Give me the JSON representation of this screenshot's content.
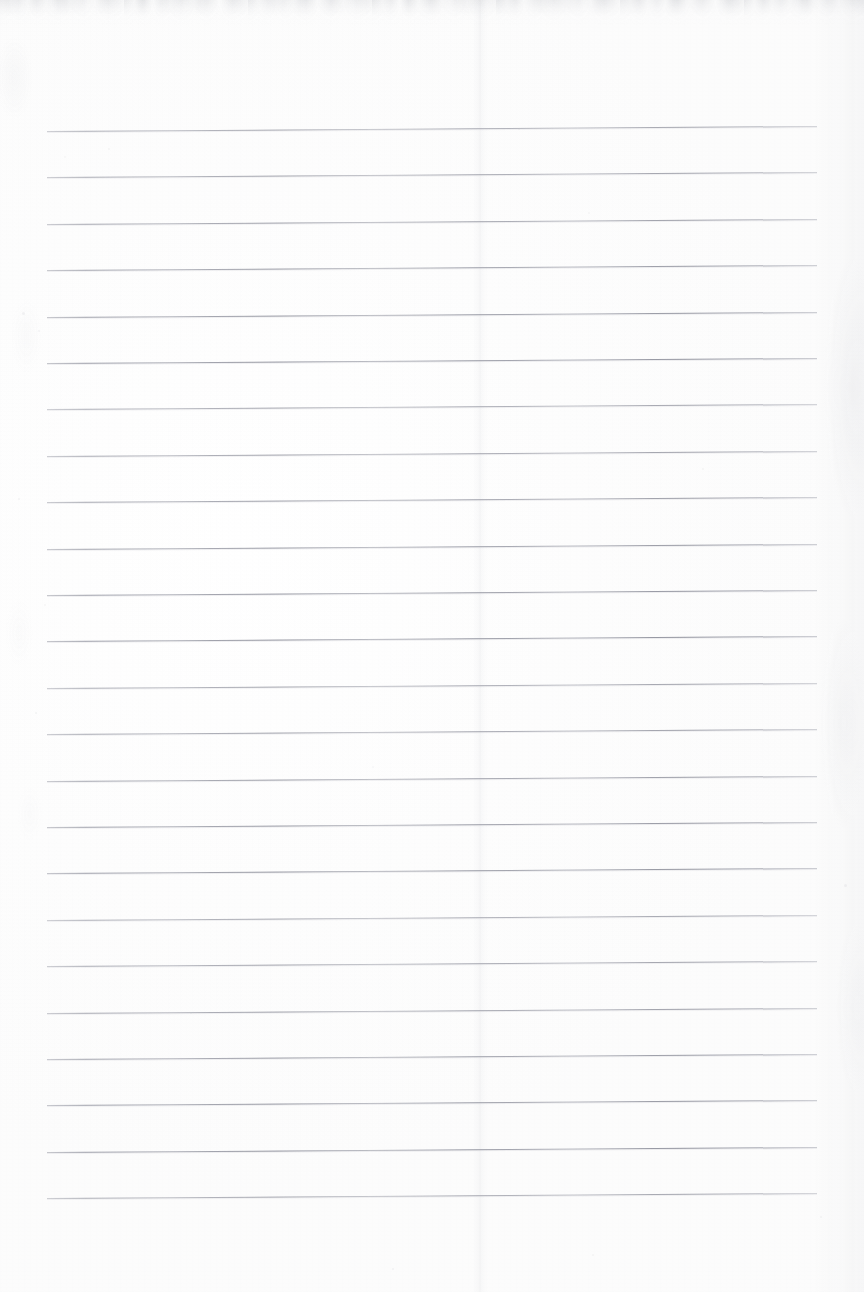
{
  "document": {
    "type": "scanned-ruled-notebook-paper",
    "title": "",
    "visible_text": "",
    "page_width": 864,
    "page_height": 1292,
    "background_color": "#fdfdfd",
    "has_handwriting": false,
    "has_printed_text": false
  },
  "ruling": {
    "line_color": "#8c8e9a",
    "line_thickness_px": 1,
    "line_count": 24,
    "line_left_x": 47,
    "line_right_x": 817,
    "line_length_px": 770,
    "first_line_y": 131,
    "last_line_y": 1198,
    "line_spacing_px": 46.4,
    "skew_degrees": -0.37,
    "lines_y": [
      131,
      177.4,
      223.8,
      270.2,
      316.6,
      363.0,
      409.4,
      455.8,
      502.2,
      548.6,
      595.0,
      641.4,
      687.8,
      734.2,
      780.6,
      827.0,
      873.4,
      919.8,
      966.2,
      1012.6,
      1059.0,
      1105.4,
      1151.8,
      1198.2
    ]
  },
  "margins": {
    "top_margin_px": 131,
    "left_margin_px": 47,
    "right_margin_px": 47,
    "bottom_margin_px": 94
  },
  "scan_artifacts": {
    "top_noise_band": {
      "color": "#b6b8be",
      "y": 0,
      "height": 26
    },
    "right_margin_texture": {
      "color": "#c4c6cd",
      "x": 812,
      "width": 52
    },
    "left_margin_texture": {
      "color": "#c6c8ce",
      "x": 0,
      "width": 48
    },
    "center_crease": {
      "color": "#c4c6cd",
      "x": 480
    },
    "specks": [
      {
        "x": 64,
        "y": 156,
        "size": 2
      },
      {
        "x": 108,
        "y": 148,
        "size": 2
      },
      {
        "x": 22,
        "y": 312,
        "size": 3
      },
      {
        "x": 38,
        "y": 330,
        "size": 2
      },
      {
        "x": 18,
        "y": 498,
        "size": 2
      },
      {
        "x": 44,
        "y": 604,
        "size": 2
      },
      {
        "x": 35,
        "y": 712,
        "size": 2
      },
      {
        "x": 372,
        "y": 766,
        "size": 2
      },
      {
        "x": 518,
        "y": 128,
        "size": 2
      },
      {
        "x": 588,
        "y": 212,
        "size": 2
      },
      {
        "x": 702,
        "y": 468,
        "size": 2
      },
      {
        "x": 844,
        "y": 884,
        "size": 3
      },
      {
        "x": 820,
        "y": 1216,
        "size": 2
      },
      {
        "x": 392,
        "y": 1268,
        "size": 2
      },
      {
        "x": 592,
        "y": 1254,
        "size": 2
      },
      {
        "x": 190,
        "y": 1012,
        "size": 2
      }
    ]
  }
}
